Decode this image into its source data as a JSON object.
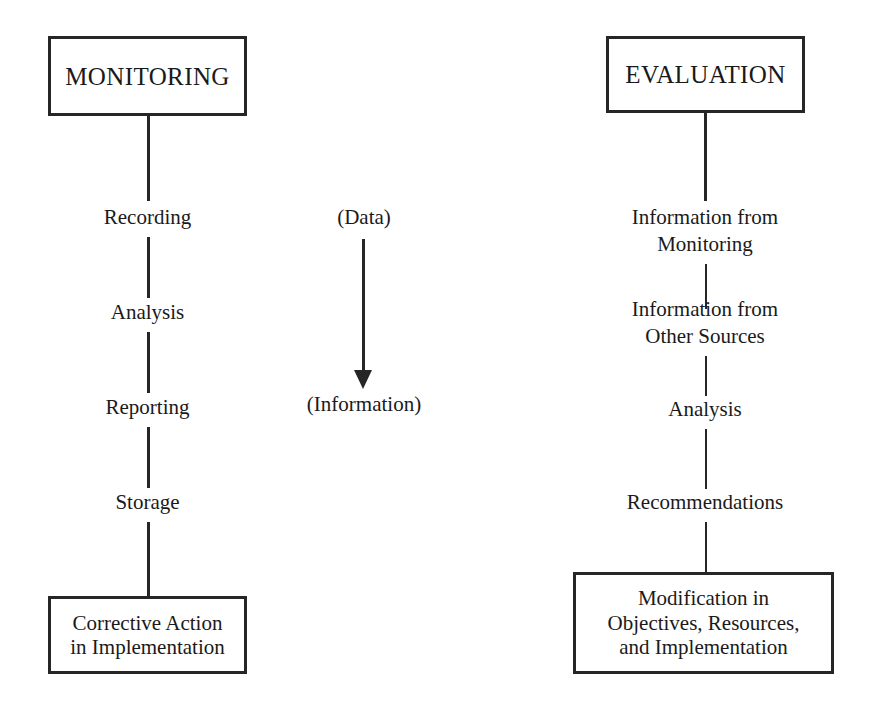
{
  "diagram": {
    "background_color": "#ffffff",
    "line_color": "#262626",
    "text_color": "#1a1a1a"
  },
  "left_chain": {
    "head_box": "MONITORING",
    "steps": [
      {
        "label": "Recording"
      },
      {
        "label": "Analysis"
      },
      {
        "label": "Reporting"
      },
      {
        "label": "Storage"
      }
    ],
    "tail_box": "Corrective Action\nin Implementation"
  },
  "right_chain": {
    "head_box": "EVALUATION",
    "steps": [
      {
        "label": "Information from\nMonitoring"
      },
      {
        "label": "Information from\nOther Sources"
      },
      {
        "label": "Analysis"
      },
      {
        "label": "Recommendations"
      }
    ],
    "tail_box": "Modification in\nObjectives, Resources,\nand Implementation"
  },
  "center_flow": {
    "source_label": "(Data)",
    "target_label": "(Information)",
    "arrow_direction": "down"
  }
}
